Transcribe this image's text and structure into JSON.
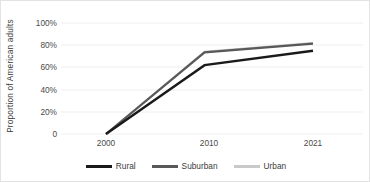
{
  "chart_data": {
    "type": "line",
    "title": "",
    "xlabel": "",
    "ylabel": "Proportion of American adults",
    "categories": [
      "2000",
      "2010",
      "2021"
    ],
    "x": [
      2000,
      2010,
      2021
    ],
    "xlim": [
      2000,
      2021
    ],
    "ylim": [
      0,
      1.0
    ],
    "ytick_labels": [
      "0",
      "20%",
      "40%",
      "60%",
      "80%",
      "100%"
    ],
    "ytick_values": [
      0,
      0.2,
      0.4,
      0.6,
      0.8,
      1.0
    ],
    "grid": true,
    "legend_position": "bottom",
    "series": [
      {
        "name": "Rural",
        "color": "#1a1a1a",
        "values": [
          0.0,
          0.62,
          0.75
        ]
      },
      {
        "name": "Suburban",
        "color": "#595959",
        "values": [
          0.0,
          0.735,
          0.815
        ]
      },
      {
        "name": "Urban",
        "color": "#c9c9c9",
        "values": [
          0.0,
          0.74,
          0.82
        ]
      }
    ]
  },
  "axes": {
    "y_title": "Proportion of American adults",
    "y_ticks": [
      {
        "label": "100%"
      },
      {
        "label": "80%"
      },
      {
        "label": "60%"
      },
      {
        "label": "40%"
      },
      {
        "label": "20%"
      },
      {
        "label": "0"
      }
    ],
    "x_ticks": [
      {
        "label": "2000"
      },
      {
        "label": "2010"
      },
      {
        "label": "2021"
      }
    ]
  },
  "legend": {
    "items": [
      {
        "label": "Rural",
        "color": "#1a1a1a"
      },
      {
        "label": "Suburban",
        "color": "#595959"
      },
      {
        "label": "Urban",
        "color": "#c9c9c9"
      }
    ]
  },
  "colors": {
    "grid": "#eeeeee",
    "border": "#e3e3e3",
    "text": "#3b3b3b",
    "background": "#ffffff"
  }
}
